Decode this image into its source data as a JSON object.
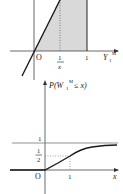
{
  "top_graph": {
    "origin_label": "O",
    "tick_inv_x_num": "1",
    "tick_inv_x_den": "x",
    "tick_one": "1",
    "x_axis_label_main": "Y",
    "x_axis_label_sub": "1",
    "x_axis_label_sup": "M",
    "colors": {
      "shade": "#d9d9d9",
      "line": "#1a1a1a"
    }
  },
  "bottom_graph": {
    "y_axis_label_prefix": "P(",
    "y_axis_label_var": "W",
    "y_axis_label_sub": "1",
    "y_axis_label_sup": "M",
    "y_axis_label_suffix": " ≤ x)",
    "level_one": "1",
    "half_num": "1",
    "half_den": "2",
    "origin_label": "O",
    "tick_one": "1",
    "x_axis_label": "x"
  }
}
